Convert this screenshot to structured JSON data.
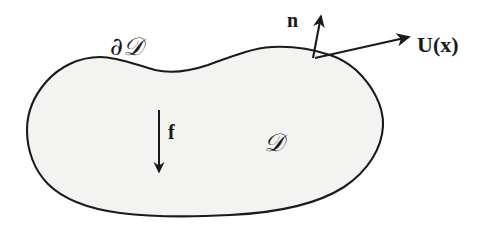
{
  "figure": {
    "kind": "math-diagram",
    "caption_visible": false,
    "background_color": "#ffffff",
    "domain_fill_color": "#f3f3f1",
    "stroke_color": "#1a1a1a",
    "width": 501,
    "height": 227
  },
  "labels": {
    "boundary": "∂𝒟",
    "boundary_plain": "∂D",
    "domain": "𝒟",
    "domain_plain": "D",
    "normal": "n",
    "velocity": "U(x)",
    "force": "f"
  },
  "arrows": {
    "normal": {
      "name": "outward-normal-arrow",
      "from": [
        313,
        58
      ],
      "to": [
        322,
        11
      ],
      "direction": "up"
    },
    "velocity": {
      "name": "velocity-arrow",
      "from": [
        315,
        58
      ],
      "to": [
        414,
        36
      ],
      "direction": "up-right"
    },
    "force": {
      "name": "body-force-arrow",
      "from": [
        159,
        110
      ],
      "to": [
        159,
        177
      ],
      "direction": "down"
    }
  },
  "shape": {
    "name": "domain-blob",
    "path": "M 330 55 C 300 47 272 46 250 51 C 228 56 205 68 182 71 C 160 74 140 66 120 60 C 100 54 78 56 60 68 C 42 80 30 100 27 122 C 24 144 30 166 44 182 C 58 198 82 208 112 212 C 150 217 200 216 248 212 C 296 208 340 196 362 176 C 384 156 388 136 383 118 C 378 100 362 80 348 68 C 341 62 336 57 330 55 Z"
  }
}
